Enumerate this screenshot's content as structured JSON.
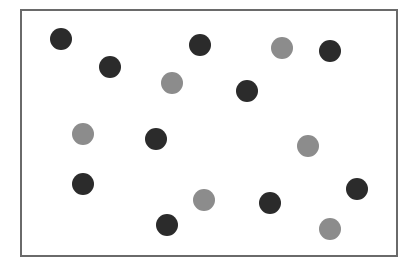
{
  "colors": {
    "background": "#ffffff",
    "frame_border": "#6a6a6a",
    "dark": "#2b2b2b",
    "gray": "#8c8c8c"
  },
  "frame": {
    "left": 20,
    "top": 9,
    "width": 378,
    "height": 248
  },
  "dot_diameter": 22,
  "dots": [
    {
      "x": 61,
      "y": 39,
      "color": "dark"
    },
    {
      "x": 110,
      "y": 67,
      "color": "dark"
    },
    {
      "x": 200,
      "y": 45,
      "color": "dark"
    },
    {
      "x": 282,
      "y": 48,
      "color": "gray"
    },
    {
      "x": 330,
      "y": 51,
      "color": "dark"
    },
    {
      "x": 172,
      "y": 83,
      "color": "gray"
    },
    {
      "x": 247,
      "y": 91,
      "color": "dark"
    },
    {
      "x": 83,
      "y": 134,
      "color": "gray"
    },
    {
      "x": 156,
      "y": 139,
      "color": "dark"
    },
    {
      "x": 308,
      "y": 146,
      "color": "gray"
    },
    {
      "x": 83,
      "y": 184,
      "color": "dark"
    },
    {
      "x": 357,
      "y": 189,
      "color": "dark"
    },
    {
      "x": 204,
      "y": 200,
      "color": "gray"
    },
    {
      "x": 270,
      "y": 203,
      "color": "dark"
    },
    {
      "x": 167,
      "y": 225,
      "color": "dark"
    },
    {
      "x": 330,
      "y": 229,
      "color": "gray"
    }
  ],
  "counts": {
    "dark": 10,
    "gray": 6,
    "total": 16
  }
}
